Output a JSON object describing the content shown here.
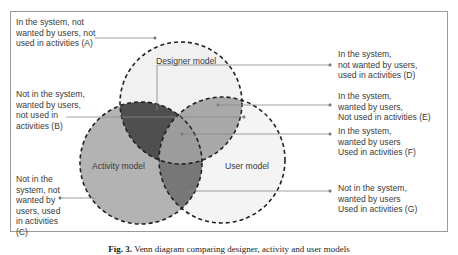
{
  "diagram": {
    "circles": [
      {
        "name": "Designer model",
        "fill": "#f1f1f1"
      },
      {
        "name": "Activity model",
        "fill": "#b3b3b3"
      },
      {
        "name": "User model",
        "fill": "#f4f4f4"
      }
    ],
    "overlap_colors": {
      "designer_activity": "#4f4f4f",
      "designer_user": "#a9a9a9",
      "activity_user": "#777777",
      "all_three": "#9c9c9c"
    },
    "labels": {
      "A": "In the system, not\nwanted by users, not\nused in activities (A)",
      "B": "Not in the system,\nwanted by users,\nnot used in\nactivities (B)",
      "C": "Not in the\nsystem, not\nwanted by\nusers, used\nin activities\n(C)",
      "D": "In the system,\nnot wanted by users,\nused in activities (D)",
      "E": "In the system,\nwanted by users,\nNot used in activities (E)",
      "F": "In the system,\nwanted by users\nUsed in activities (F)",
      "G": "Not in the system,\nwanted by users\nUsed in activities (G)"
    }
  },
  "caption": {
    "prefix": "Fig. 3.",
    "text": "Venn diagram comparing designer, activity and user models"
  }
}
